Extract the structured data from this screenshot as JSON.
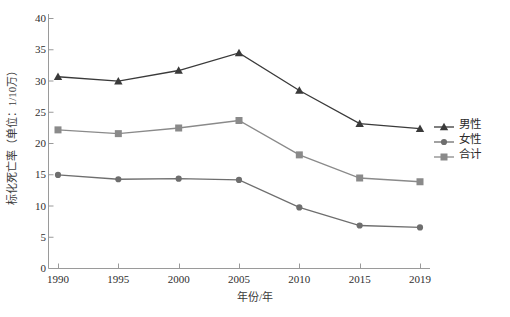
{
  "chart_data": {
    "type": "line",
    "title": "",
    "xlabel": "年份/年",
    "ylabel": "标化死亡率（单位：1/10万）",
    "categories": [
      "1990",
      "1995",
      "2000",
      "2005",
      "2010",
      "2015",
      "2019"
    ],
    "x": [
      1990,
      1995,
      2000,
      2005,
      2010,
      2015,
      2019
    ],
    "ylim": [
      0,
      40
    ],
    "yticks": [
      0,
      5,
      10,
      15,
      20,
      25,
      30,
      35,
      40
    ],
    "ytick_labels": [
      "0",
      "5",
      "10",
      "15",
      "20",
      "25",
      "30",
      "35",
      "40"
    ],
    "grid": false,
    "legend_position": "right",
    "series": [
      {
        "name": "男性",
        "marker": "triangle",
        "color": "#3a3a3a",
        "values": [
          30.6,
          29.9,
          31.6,
          34.4,
          28.4,
          23.1,
          22.3
        ]
      },
      {
        "name": "合计",
        "marker": "square",
        "color": "#8a8a8a",
        "values": [
          22.1,
          21.5,
          22.4,
          23.6,
          18.1,
          14.4,
          13.8
        ]
      },
      {
        "name": "女性",
        "marker": "circle",
        "color": "#6e6e6e",
        "values": [
          14.9,
          14.2,
          14.3,
          14.1,
          9.7,
          6.8,
          6.5
        ]
      }
    ]
  },
  "legend": {
    "items": [
      {
        "label": "男性",
        "marker": "triangle",
        "color": "#3a3a3a"
      },
      {
        "label": "女性",
        "marker": "circle",
        "color": "#6e6e6e"
      },
      {
        "label": "合计",
        "marker": "square",
        "color": "#8a8a8a"
      }
    ]
  },
  "axes": {
    "y_title": "标化死亡率（单位：1/10万）",
    "x_title": "年份/年"
  },
  "colors": {
    "axis": "#9a9a9a",
    "text": "#2e2e2e",
    "background": "#ffffff"
  }
}
